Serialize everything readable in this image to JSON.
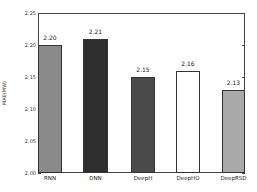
{
  "chart_data": {
    "type": "bar",
    "title": "",
    "xlabel": "",
    "ylabel": "MAE(MW)",
    "ylim": [
      2.0,
      2.25
    ],
    "yticks": [
      "2.00",
      "2.05",
      "2.10",
      "2.15",
      "2.20",
      "2.25"
    ],
    "categories": [
      "RNN",
      "DNN",
      "DeepH",
      "DeepHO",
      "DeepRSD"
    ],
    "values": [
      2.2,
      2.21,
      2.15,
      2.16,
      2.13
    ],
    "value_labels": [
      "2.20",
      "2.21",
      "2.15",
      "2.16",
      "2.13"
    ],
    "bar_fills": [
      "#8a8a8a",
      "#2e2e2e",
      "#4a4a4a",
      "#ffffff",
      "#a9a9a9"
    ],
    "grid": false,
    "legend": null
  }
}
